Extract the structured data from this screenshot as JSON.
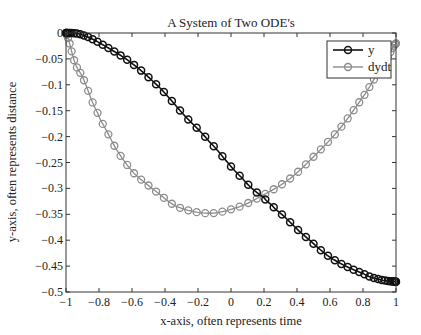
{
  "chart_data": {
    "type": "line",
    "title": "A System of Two ODE's",
    "xlabel": "x-axis, often represents time",
    "ylabel": "y-axis, often represents distance",
    "xlim": [
      -1,
      1
    ],
    "ylim": [
      -0.5,
      0
    ],
    "grid": false,
    "legend_position": "northeast",
    "x_ticks": [
      -1,
      -0.8,
      -0.6,
      -0.4,
      -0.2,
      0,
      0.2,
      0.4,
      0.6,
      0.8,
      1
    ],
    "x_tick_labels": [
      "−1",
      "−0.8",
      "−0.6",
      "−0.4",
      "−0.2",
      "0",
      "0.2",
      "0.4",
      "0.6",
      "0.8",
      "1"
    ],
    "y_ticks": [
      0,
      -0.05,
      -0.1,
      -0.15,
      -0.2,
      -0.25,
      -0.3,
      -0.35,
      -0.4,
      -0.45,
      -0.5
    ],
    "y_tick_labels": [
      "0",
      "−0.05",
      "−0.1",
      "−0.15",
      "−0.2",
      "−0.25",
      "−0.3",
      "−0.35",
      "−0.4",
      "−0.45",
      "−0.5"
    ],
    "series": [
      {
        "name": "y",
        "color": "#111111",
        "marker": "circle",
        "x": [
          -1,
          -0.9,
          -0.737,
          -0.586,
          -0.424,
          -0.283,
          -0.131,
          0.065,
          0.2,
          0.267,
          0.418,
          0.6,
          0.8,
          0.903,
          1
        ],
        "values": [
          0,
          -0.004,
          -0.03,
          -0.062,
          -0.108,
          -0.159,
          -0.21,
          -0.279,
          -0.318,
          -0.34,
          -0.384,
          -0.433,
          -0.464,
          -0.476,
          -0.48
        ]
      },
      {
        "name": "dydt",
        "color": "#8c8c8c",
        "marker": "circle",
        "x": [
          -1,
          -0.945,
          -0.897,
          -0.84,
          -0.79,
          -0.69,
          -0.59,
          -0.48,
          -0.33,
          -0.13,
          0.055,
          0.206,
          0.358,
          0.509,
          0.661,
          0.812,
          0.95,
          1
        ],
        "values": [
          0,
          -0.058,
          -0.087,
          -0.133,
          -0.169,
          -0.227,
          -0.27,
          -0.3,
          -0.335,
          -0.348,
          -0.335,
          -0.311,
          -0.281,
          -0.236,
          -0.184,
          -0.118,
          -0.05,
          -0.02
        ]
      }
    ],
    "marker_count": 60
  }
}
